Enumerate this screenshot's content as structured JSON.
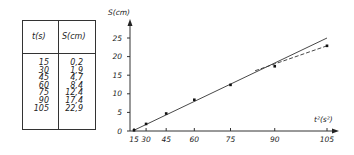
{
  "table": {
    "headers": [
      "t(s)",
      "S(cm)"
    ],
    "rows": [
      [
        "15",
        "0,2"
      ],
      [
        "30",
        "1,9"
      ],
      [
        "45",
        "4,7"
      ],
      [
        "60",
        "8,4"
      ],
      [
        "75",
        "12,4"
      ],
      [
        "90",
        "17,4"
      ],
      [
        "105",
        "22,9"
      ]
    ],
    "col_t": "15\n30\n45\n60\n75\n90\n105",
    "col_s": "0,2\n1,9\n4,7\n8,4\n12,4\n17,4\n22,9"
  },
  "chart_data": {
    "type": "scatter",
    "title": "",
    "xlabel": "t²(s²)",
    "ylabel": "S(cm)",
    "x_tick_labels": [
      "15",
      "30",
      "45",
      "60",
      "75",
      "90",
      "105"
    ],
    "y_tick_labels": [
      "0",
      "5",
      "10",
      "15",
      "20",
      "25"
    ],
    "xlim": [
      0,
      11025
    ],
    "ylim": [
      0,
      27
    ],
    "grid": false,
    "series": [
      {
        "name": "measured",
        "x_t": [
          15,
          30,
          45,
          60,
          75,
          90,
          105
        ],
        "x_t2": [
          225,
          900,
          2025,
          3600,
          5625,
          8100,
          11025
        ],
        "y": [
          0.2,
          1.9,
          4.7,
          8.4,
          12.4,
          17.4,
          22.9
        ]
      },
      {
        "name": "linear fit (solid)",
        "style": "solid",
        "points": [
          [
            225,
            0.2
          ],
          [
            11025,
            25
          ]
        ]
      },
      {
        "name": "measured trend (dashed)",
        "style": "dashed",
        "points": [
          [
            7000,
            16.2
          ],
          [
            11025,
            22.9
          ]
        ]
      }
    ]
  }
}
